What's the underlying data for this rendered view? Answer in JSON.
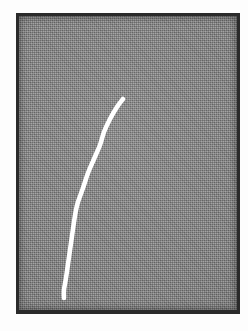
{
  "figure": {
    "caption": "",
    "plate": {
      "background_color": "#848484",
      "border_color": "#2a2a2a",
      "page_color": "#fdfdfd",
      "left": 16,
      "top": 13,
      "width": 224,
      "height": 301
    },
    "trace": {
      "label": "particle-track",
      "color": "#ffffff",
      "stroke_width": 4.6,
      "start_point": [
        123,
        99
      ],
      "end_point": [
        64,
        298
      ],
      "points": [
        [
          123,
          99
        ],
        [
          117,
          107
        ],
        [
          110,
          119
        ],
        [
          104,
          132
        ],
        [
          100,
          145
        ],
        [
          94,
          159
        ],
        [
          88,
          173
        ],
        [
          83,
          188
        ],
        [
          78,
          202
        ],
        [
          76,
          210
        ],
        [
          74,
          222
        ],
        [
          72,
          236
        ],
        [
          70,
          250
        ],
        [
          68,
          264
        ],
        [
          66,
          278
        ],
        [
          64,
          290
        ],
        [
          64,
          298
        ]
      ]
    }
  }
}
